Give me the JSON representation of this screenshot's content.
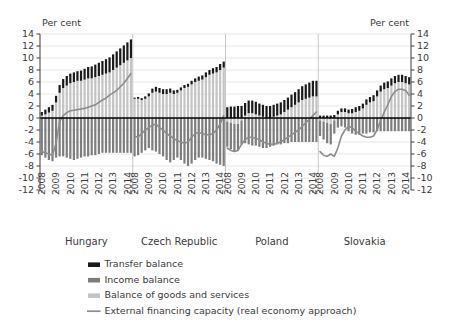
{
  "chart_data": {
    "type": "bar",
    "title": "",
    "subtitle": "",
    "ylabel_left": "Per cent",
    "ylabel_right": "Per cent",
    "xlabel": "",
    "ylim": [
      -12,
      14
    ],
    "ytick_step": 2,
    "yticks": [
      14,
      12,
      10,
      8,
      6,
      4,
      2,
      0,
      -2,
      -4,
      -6,
      -8,
      -10,
      -12
    ],
    "grid": true,
    "legend_position": "bottom-left",
    "stacked": true,
    "x_tick_labels": [
      "2008",
      "2009",
      "2010",
      "2011",
      "2012",
      "2013",
      "2014"
    ],
    "panels": [
      {
        "name": "Hungary",
        "quarters": [
          "2008Q1",
          "2008Q2",
          "2008Q3",
          "2008Q4",
          "2009Q1",
          "2009Q2",
          "2009Q3",
          "2009Q4",
          "2010Q1",
          "2010Q2",
          "2010Q3",
          "2010Q4",
          "2011Q1",
          "2011Q2",
          "2011Q3",
          "2011Q4",
          "2012Q1",
          "2012Q2",
          "2012Q3",
          "2012Q4",
          "2013Q1",
          "2013Q2",
          "2013Q3",
          "2013Q4",
          "2014Q1",
          "2014Q2"
        ],
        "series": [
          {
            "name": "Balance of goods and services",
            "values": [
              0.4,
              0.6,
              0.9,
              1.2,
              2.6,
              4.2,
              5.0,
              5.4,
              5.8,
              6.0,
              6.2,
              6.2,
              6.4,
              6.6,
              6.6,
              6.8,
              7.0,
              7.2,
              7.4,
              7.6,
              8.0,
              8.4,
              8.8,
              9.2,
              9.6,
              10.0
            ]
          },
          {
            "name": "Income balance",
            "values": [
              -6.2,
              -6.6,
              -7.0,
              -7.2,
              -6.6,
              -6.4,
              -6.4,
              -6.6,
              -6.8,
              -7.0,
              -6.8,
              -6.6,
              -6.4,
              -6.4,
              -6.2,
              -6.2,
              -6.0,
              -5.8,
              -5.8,
              -5.8,
              -5.8,
              -5.8,
              -5.8,
              -5.8,
              -5.8,
              -5.8
            ]
          },
          {
            "name": "Transfer balance",
            "values": [
              0.6,
              0.8,
              0.9,
              1.0,
              1.1,
              1.3,
              1.5,
              1.6,
              1.6,
              1.6,
              1.6,
              1.7,
              1.8,
              1.9,
              2.0,
              2.1,
              2.2,
              2.3,
              2.4,
              2.5,
              2.6,
              2.7,
              2.8,
              2.9,
              3.0,
              3.1
            ]
          }
        ],
        "line": {
          "name": "External financing capacity (real economy approach)",
          "values": [
            -5.6,
            -5.8,
            -6.0,
            -6.2,
            -4.2,
            -0.6,
            0.4,
            0.9,
            1.2,
            1.3,
            1.4,
            1.5,
            1.6,
            1.8,
            2.0,
            2.2,
            2.6,
            3.0,
            3.3,
            3.8,
            4.2,
            4.6,
            5.2,
            5.8,
            6.6,
            7.4
          ]
        }
      },
      {
        "name": "Czech Republic",
        "quarters": [
          "2008Q1",
          "2008Q2",
          "2008Q3",
          "2008Q4",
          "2009Q1",
          "2009Q2",
          "2009Q3",
          "2009Q4",
          "2010Q1",
          "2010Q2",
          "2010Q3",
          "2010Q4",
          "2011Q1",
          "2011Q2",
          "2011Q3",
          "2011Q4",
          "2012Q1",
          "2012Q2",
          "2012Q3",
          "2012Q4",
          "2013Q1",
          "2013Q2",
          "2013Q3",
          "2013Q4",
          "2014Q1",
          "2014Q2"
        ],
        "series": [
          {
            "name": "Balance of goods and services",
            "values": [
              3.2,
              3.2,
              3.0,
              3.2,
              3.6,
              4.2,
              4.4,
              4.2,
              4.0,
              4.0,
              4.2,
              4.0,
              4.2,
              4.6,
              5.0,
              5.2,
              5.6,
              6.0,
              6.2,
              6.4,
              6.8,
              7.2,
              7.4,
              7.6,
              8.0,
              8.4
            ]
          },
          {
            "name": "Income balance",
            "values": [
              -6.4,
              -6.2,
              -5.8,
              -5.4,
              -5.0,
              -5.4,
              -5.6,
              -6.0,
              -6.4,
              -7.0,
              -7.4,
              -7.0,
              -6.6,
              -7.0,
              -7.6,
              -8.0,
              -7.6,
              -7.0,
              -6.6,
              -6.6,
              -6.8,
              -7.0,
              -7.2,
              -7.6,
              -7.8,
              -8.0
            ]
          },
          {
            "name": "Transfer balance",
            "values": [
              0.2,
              0.3,
              0.3,
              0.4,
              0.5,
              0.7,
              0.8,
              0.8,
              0.8,
              0.8,
              0.7,
              0.6,
              0.5,
              0.5,
              0.5,
              0.5,
              0.6,
              0.6,
              0.7,
              0.7,
              0.8,
              0.8,
              0.9,
              0.9,
              1.0,
              1.0
            ]
          }
        ],
        "line": {
          "name": "External financing capacity (real economy approach)",
          "values": [
            -3.0,
            -3.2,
            -2.6,
            -2.0,
            -1.6,
            -1.2,
            -1.0,
            -1.6,
            -2.0,
            -2.6,
            -3.0,
            -3.4,
            -3.8,
            -4.0,
            -4.2,
            -4.0,
            -3.2,
            -2.6,
            -2.4,
            -2.6,
            -2.8,
            -2.8,
            -2.6,
            -2.0,
            -1.0,
            0.4
          ]
        }
      },
      {
        "name": "Poland",
        "quarters": [
          "2008Q1",
          "2008Q2",
          "2008Q3",
          "2008Q4",
          "2009Q1",
          "2009Q2",
          "2009Q3",
          "2009Q4",
          "2010Q1",
          "2010Q2",
          "2010Q3",
          "2010Q4",
          "2011Q1",
          "2011Q2",
          "2011Q3",
          "2011Q4",
          "2012Q1",
          "2012Q2",
          "2012Q3",
          "2012Q4",
          "2013Q1",
          "2013Q2",
          "2013Q3",
          "2013Q4",
          "2014Q1",
          "2014Q2"
        ],
        "series": [
          {
            "name": "Balance of goods and services",
            "values": [
              -0.6,
              -0.8,
              -1.0,
              -1.0,
              -0.4,
              0.4,
              0.8,
              0.8,
              0.6,
              0.4,
              0.2,
              0.0,
              0.0,
              0.2,
              0.4,
              0.6,
              1.0,
              1.4,
              1.8,
              2.2,
              2.6,
              3.0,
              3.2,
              3.4,
              3.6,
              3.6
            ]
          },
          {
            "name": "Income balance",
            "values": [
              -4.2,
              -4.4,
              -4.6,
              -4.4,
              -4.0,
              -4.2,
              -4.4,
              -4.6,
              -4.6,
              -4.8,
              -5.0,
              -5.0,
              -4.8,
              -4.6,
              -4.4,
              -4.4,
              -4.2,
              -4.2,
              -4.0,
              -4.0,
              -4.0,
              -4.0,
              -4.0,
              -4.0,
              -4.0,
              -4.0
            ]
          },
          {
            "name": "Transfer balance",
            "values": [
              1.8,
              1.9,
              1.9,
              2.0,
              2.0,
              2.1,
              2.1,
              2.1,
              2.1,
              2.0,
              2.0,
              2.0,
              2.0,
              2.0,
              2.0,
              2.0,
              2.0,
              2.0,
              2.1,
              2.1,
              2.2,
              2.3,
              2.4,
              2.5,
              2.6,
              2.6
            ]
          }
        ],
        "line": {
          "name": "External financing capacity (real economy approach)",
          "values": [
            -5.0,
            -5.4,
            -5.6,
            -5.4,
            -4.4,
            -3.6,
            -3.2,
            -3.2,
            -3.4,
            -3.6,
            -4.0,
            -4.2,
            -4.4,
            -4.4,
            -4.2,
            -4.0,
            -3.6,
            -3.2,
            -2.8,
            -2.4,
            -2.0,
            -1.4,
            -0.8,
            -0.2,
            0.4,
            1.0
          ]
        }
      },
      {
        "name": "Slovakia",
        "quarters": [
          "2008Q1",
          "2008Q2",
          "2008Q3",
          "2008Q4",
          "2009Q1",
          "2009Q2",
          "2009Q3",
          "2009Q4",
          "2010Q1",
          "2010Q2",
          "2010Q3",
          "2010Q4",
          "2011Q1",
          "2011Q2",
          "2011Q3",
          "2011Q4",
          "2012Q1",
          "2012Q2",
          "2012Q3",
          "2012Q4",
          "2013Q1",
          "2013Q2",
          "2013Q3",
          "2013Q4",
          "2014Q1",
          "2014Q2"
        ],
        "series": [
          {
            "name": "Balance of goods and services",
            "values": [
              -0.4,
              -0.6,
              -0.8,
              -1.0,
              -0.4,
              0.6,
              1.0,
              1.0,
              0.8,
              0.8,
              1.0,
              1.2,
              1.6,
              2.2,
              2.6,
              2.8,
              3.6,
              4.4,
              4.8,
              5.0,
              5.4,
              5.8,
              6.0,
              6.0,
              5.8,
              5.6
            ]
          },
          {
            "name": "Income balance",
            "values": [
              -2.6,
              -3.0,
              -3.4,
              -3.4,
              -2.2,
              -1.6,
              -1.4,
              -1.6,
              -2.2,
              -2.6,
              -2.8,
              -2.8,
              -2.6,
              -2.6,
              -2.4,
              -2.4,
              -2.2,
              -2.2,
              -2.2,
              -2.2,
              -2.2,
              -2.2,
              -2.2,
              -2.2,
              -2.2,
              -2.2
            ]
          },
          {
            "name": "Transfer balance",
            "values": [
              0.4,
              0.4,
              0.4,
              0.4,
              0.5,
              0.6,
              0.6,
              0.6,
              0.6,
              0.7,
              0.8,
              0.8,
              0.8,
              0.9,
              0.9,
              1.0,
              1.0,
              1.0,
              1.1,
              1.1,
              1.2,
              1.2,
              1.2,
              1.2,
              1.2,
              1.2
            ]
          }
        ],
        "line": {
          "name": "External financing capacity (real economy approach)",
          "values": [
            -5.6,
            -6.2,
            -6.4,
            -6.0,
            -6.4,
            -5.0,
            -3.0,
            -2.0,
            -1.4,
            -1.6,
            -2.2,
            -2.6,
            -3.0,
            -3.2,
            -3.2,
            -3.0,
            -2.0,
            -0.4,
            1.0,
            2.2,
            3.6,
            4.4,
            4.8,
            4.8,
            4.6,
            3.8
          ]
        }
      }
    ],
    "legend": [
      {
        "label": "Transfer balance",
        "type": "bar",
        "color": "#1a1a1a"
      },
      {
        "label": "Income balance",
        "type": "bar",
        "color": "#7d7d7d"
      },
      {
        "label": "Balance of goods and services",
        "type": "bar",
        "color": "#c4c4c4"
      },
      {
        "label": "External financing capacity (real economy approach)",
        "type": "line",
        "color": "#8c8c8c"
      }
    ],
    "colors": {
      "transfer_balance": "#1a1a1a",
      "income_balance": "#7d7d7d",
      "goods_services": "#c4c4c4",
      "financing_line": "#8c8c8c",
      "axis": "#4d4d4d",
      "grid": "#dcdcdc",
      "zero_line": "#000000",
      "background": "#ffffff"
    }
  }
}
